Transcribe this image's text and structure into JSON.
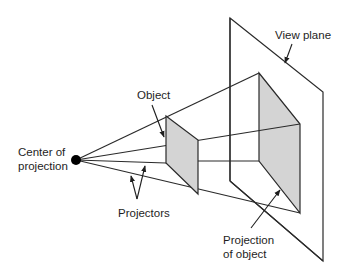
{
  "diagram": {
    "labels": {
      "view_plane": "View plane",
      "object": "Object",
      "center_line1": "Center of",
      "center_line2": "projection",
      "projectors": "Projectors",
      "projection_line1": "Projection",
      "projection_line2": "of object"
    },
    "colors": {
      "stroke": "#2a2a2a",
      "face_fill": "#d4d4d4",
      "point": "#000000",
      "background": "#ffffff"
    },
    "geometry": {
      "center_of_projection": [
        76,
        160
      ],
      "object_face": [
        [
          166,
          116
        ],
        [
          198,
          140
        ],
        [
          198,
          194
        ],
        [
          166,
          163
        ]
      ],
      "projection_face": [
        [
          259,
          73
        ],
        [
          300,
          124
        ],
        [
          300,
          213
        ],
        [
          259,
          161
        ]
      ],
      "view_plane": [
        [
          230,
          18
        ],
        [
          323,
          92
        ],
        [
          323,
          261
        ],
        [
          230,
          181
        ]
      ]
    }
  }
}
